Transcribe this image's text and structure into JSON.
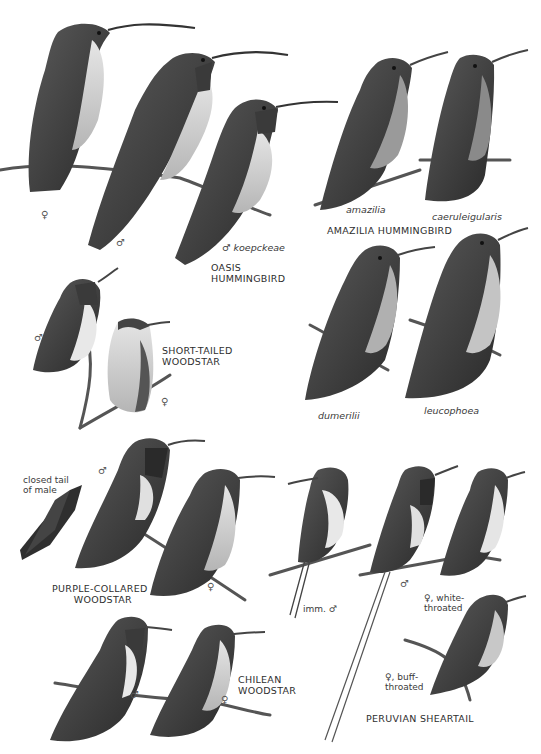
{
  "plate": {
    "background": "#ffffff",
    "ink": "#2a2a2a",
    "species": [
      {
        "name": "OASIS\nHUMMINGBIRD",
        "figures": [
          {
            "label": "♀"
          },
          {
            "label": "♂"
          },
          {
            "label": "♂ koepckeae"
          }
        ]
      },
      {
        "name": "AMAZILIA HUMMINGBIRD",
        "figures": [
          {
            "label": "amazilia"
          },
          {
            "label": "caeruleigularis"
          },
          {
            "label": "dumerilii"
          },
          {
            "label": "leucophoea"
          }
        ]
      },
      {
        "name": "SHORT-TAILED\nWOODSTAR",
        "figures": [
          {
            "label": "♂"
          },
          {
            "label": "♀"
          }
        ]
      },
      {
        "name": "PURPLE-COLLARED\nWOODSTAR",
        "figures": [
          {
            "label": "closed tail\nof male"
          },
          {
            "label": "♂"
          },
          {
            "label": "♀"
          }
        ]
      },
      {
        "name": "CHILEAN\nWOODSTAR",
        "figures": [
          {
            "label": "♂"
          },
          {
            "label": "♀"
          }
        ]
      },
      {
        "name": "PERUVIAN SHEARTAIL",
        "figures": [
          {
            "label": "imm. ♂"
          },
          {
            "label": "♂"
          },
          {
            "label": "♀, white-\nthroated"
          },
          {
            "label": "♀, buff-\nthroated"
          }
        ]
      }
    ]
  }
}
